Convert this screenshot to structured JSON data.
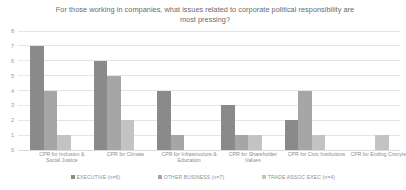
{
  "chart_data": {
    "type": "bar",
    "title": "For those working in companies, what issues related to corporate political responsibility are most pressing?",
    "title_line1": "For those working in companies, what issues related to corporate political",
    "title_line2": "responsibility are most pressing?",
    "xlabel": "",
    "ylabel": "",
    "ylim": [
      0,
      8
    ],
    "yticks": [
      "0",
      "1",
      "2",
      "3",
      "4",
      "5",
      "6",
      "7",
      "8"
    ],
    "grid": true,
    "legend_position": "bottom",
    "categories": [
      "CPR for Inclusion & Social Justice",
      "CPR for Climate",
      "CPR for Infrastructure & Education",
      "CPR for Shareholder Values",
      "CPR for Civic Institutions",
      "CPR for Ending Cronyism"
    ],
    "category_lines": [
      [
        "CPR for Inclusion &",
        "Social Justice"
      ],
      [
        "CPR for Climate",
        ""
      ],
      [
        "CPR for Infrastructure &",
        "Education"
      ],
      [
        "CPR for Shareholder",
        "Values"
      ],
      [
        "CPR for Civic Institutions",
        ""
      ],
      [
        "CPR for Ending Cronyism",
        ""
      ]
    ],
    "series": [
      {
        "name": "EXECUTIVE (n=6)",
        "color": "#8a8a8a",
        "values": [
          7,
          6,
          4,
          3,
          2,
          0
        ]
      },
      {
        "name": "OTHER BUSINESS (n=7)",
        "color": "#a6a6a6",
        "values": [
          4,
          5,
          1,
          1,
          4,
          0
        ]
      },
      {
        "name": "TRADE ASSOC EXEC (n=4)",
        "color": "#c3c3c3",
        "values": [
          1,
          2,
          0,
          1,
          1,
          1
        ]
      }
    ]
  },
  "colors": {
    "background": "#ffffff",
    "gridline": "#e4e4e4",
    "title_text": "#6a6a6a",
    "axis_text": "#9a9a9a",
    "legend_text": "#8f8f8f"
  }
}
